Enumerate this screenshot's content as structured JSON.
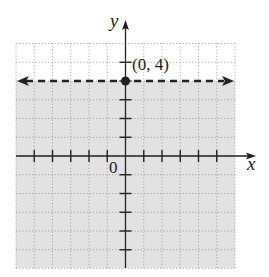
{
  "chart_data": {
    "type": "line",
    "title": "",
    "xlabel": "x",
    "ylabel": "y",
    "origin_label": "0",
    "xlim": [
      -6,
      6
    ],
    "ylim": [
      -6,
      6
    ],
    "grid": true,
    "grid_style": "dotted",
    "x_ticks": [
      -5,
      -4,
      -3,
      -2,
      -1,
      1,
      2,
      3,
      4,
      5
    ],
    "y_ticks": [
      5,
      4,
      3,
      2,
      1,
      -1,
      -2,
      -3,
      -4,
      -5
    ],
    "boundary_line": {
      "equation": "y = 4",
      "style": "dashed",
      "arrows": "both",
      "y": 4
    },
    "shaded_region": {
      "inequality": "y < 4",
      "side": "below"
    },
    "points": [
      {
        "x": 0,
        "y": 4,
        "label": "(0, 4)",
        "filled": true
      }
    ]
  },
  "labels": {
    "x_axis": "x",
    "y_axis": "y",
    "origin": "0",
    "point": "(0, 4)"
  },
  "colors": {
    "shade": "#e2e2e2",
    "grid": "#9a9a9a",
    "axis": "#222222",
    "line": "#222222"
  }
}
